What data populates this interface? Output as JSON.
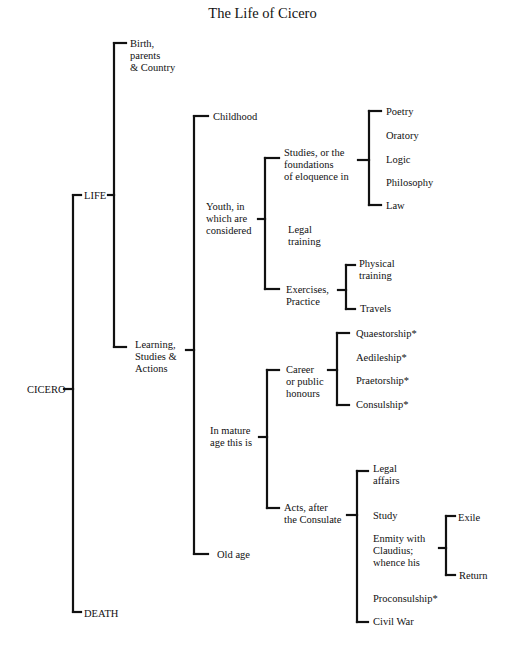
{
  "title": "The Life of Cicero",
  "line_color": "#111111",
  "nodes": [
    {
      "id": "cicero",
      "label": "CICERO",
      "x": 27,
      "y": 384
    },
    {
      "id": "life",
      "label": "LIFE",
      "x": 84,
      "y": 190
    },
    {
      "id": "death",
      "label": "DEATH",
      "x": 84,
      "y": 608
    },
    {
      "id": "birth",
      "label": "Birth,\nparents\n& Country",
      "x": 130,
      "y": 38
    },
    {
      "id": "learning",
      "label": "Learning,\nStudies &\nActions",
      "x": 135,
      "y": 339
    },
    {
      "id": "childhood",
      "label": "Childhood",
      "x": 213,
      "y": 111
    },
    {
      "id": "youth",
      "label": "Youth, in\nwhich are\nconsidered",
      "x": 206,
      "y": 201
    },
    {
      "id": "mature",
      "label": "In mature\nage this is",
      "x": 210,
      "y": 425
    },
    {
      "id": "oldage",
      "label": "Old age",
      "x": 217,
      "y": 549
    },
    {
      "id": "studies",
      "label": "Studies, or the\nfoundations\nof eloquence in",
      "x": 284,
      "y": 147
    },
    {
      "id": "legal_training",
      "label": "Legal\ntraining",
      "x": 288,
      "y": 224
    },
    {
      "id": "exercises",
      "label": "Exercises,\nPractice",
      "x": 286,
      "y": 284
    },
    {
      "id": "poetry",
      "label": "Poetry",
      "x": 386,
      "y": 106
    },
    {
      "id": "oratory",
      "label": "Oratory",
      "x": 386,
      "y": 130
    },
    {
      "id": "logic",
      "label": "Logic",
      "x": 386,
      "y": 154
    },
    {
      "id": "philosophy",
      "label": "Philosophy",
      "x": 386,
      "y": 177
    },
    {
      "id": "law",
      "label": "Law",
      "x": 386,
      "y": 200
    },
    {
      "id": "physical",
      "label": "Physical\ntraining",
      "x": 359,
      "y": 258
    },
    {
      "id": "travels",
      "label": "Travels",
      "x": 360,
      "y": 303
    },
    {
      "id": "career",
      "label": "Career\nor public\nhonours",
      "x": 286,
      "y": 364
    },
    {
      "id": "acts",
      "label": "Acts, after\nthe Consulate",
      "x": 284,
      "y": 502
    },
    {
      "id": "quaestorship",
      "label": "Quaestorship*",
      "x": 356,
      "y": 328
    },
    {
      "id": "aedileship",
      "label": "Aedileship*",
      "x": 356,
      "y": 352
    },
    {
      "id": "praetorship",
      "label": "Praetorship*",
      "x": 356,
      "y": 375
    },
    {
      "id": "consulship",
      "label": "Consulship*",
      "x": 356,
      "y": 399
    },
    {
      "id": "legal_affairs",
      "label": "Legal\naffairs",
      "x": 373,
      "y": 463
    },
    {
      "id": "study",
      "label": "Study",
      "x": 373,
      "y": 510
    },
    {
      "id": "enmity",
      "label": "Enmity with\nClaudius;\nwhence his",
      "x": 373,
      "y": 533
    },
    {
      "id": "proconsulship",
      "label": "Proconsulship*",
      "x": 373,
      "y": 593
    },
    {
      "id": "civilwar",
      "label": "Civil War",
      "x": 373,
      "y": 616
    },
    {
      "id": "exile",
      "label": "Exile",
      "x": 458,
      "y": 512
    },
    {
      "id": "return",
      "label": "Return",
      "x": 459,
      "y": 570
    }
  ],
  "brackets": [
    {
      "parent": "cicero",
      "stub": [
        64,
        389
      ],
      "x": 73,
      "top": 195,
      "bottom": 612,
      "ticks": [
        195,
        612
      ],
      "tick_len": 8
    },
    {
      "parent": "life",
      "stub": [
        108,
        195
      ],
      "x": 114,
      "top": 43,
      "bottom": 347,
      "ticks": [
        43,
        347
      ],
      "tick_len": 12
    },
    {
      "parent": "learning",
      "stub": [
        186,
        350
      ],
      "x": 194,
      "top": 116,
      "bottom": 554,
      "ticks": [
        116,
        554
      ],
      "tick_len": 14
    },
    {
      "parent": "youth",
      "stub": [
        258,
        219
      ],
      "x": 265,
      "top": 158,
      "bottom": 289,
      "ticks": [
        158,
        289
      ],
      "tick_len": 14
    },
    {
      "parent": "studies",
      "stub": [
        358,
        160
      ],
      "x": 369,
      "top": 111,
      "bottom": 205,
      "ticks": [
        111,
        205
      ],
      "tick_len": 12
    },
    {
      "parent": "exercises",
      "stub": [
        338,
        290
      ],
      "x": 346,
      "top": 265,
      "bottom": 309,
      "ticks": [
        265,
        309
      ],
      "tick_len": 9
    },
    {
      "parent": "mature",
      "stub": [
        259,
        437
      ],
      "x": 267,
      "top": 370,
      "bottom": 508,
      "ticks": [
        370,
        508
      ],
      "tick_len": 12
    },
    {
      "parent": "career",
      "stub": [
        328,
        370
      ],
      "x": 337,
      "top": 333,
      "bottom": 405,
      "ticks": [
        333,
        405
      ],
      "tick_len": 12
    },
    {
      "parent": "acts",
      "stub": [
        347,
        515
      ],
      "x": 357,
      "top": 471,
      "bottom": 622,
      "ticks": [
        471,
        622
      ],
      "tick_len": 11
    },
    {
      "parent": "enmity",
      "stub": [
        439,
        548
      ],
      "x": 446,
      "top": 516,
      "bottom": 575,
      "ticks": [
        516,
        575
      ],
      "tick_len": 9
    }
  ]
}
